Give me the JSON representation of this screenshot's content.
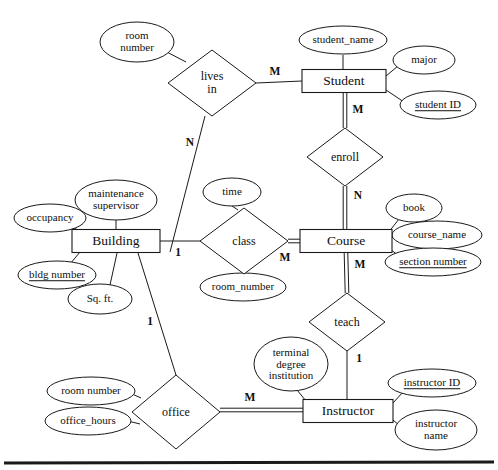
{
  "diagram": {
    "notation": "Chen",
    "stroke_color": "#1a1a1a",
    "fill_color": "#ffffff",
    "background": "#ffffff",
    "entities": [
      {
        "id": "building",
        "label": "Building",
        "cx": 116,
        "cy": 241,
        "w": 88,
        "h": 23
      },
      {
        "id": "student",
        "label": "Student",
        "cx": 344,
        "cy": 81,
        "w": 84,
        "h": 23
      },
      {
        "id": "course",
        "label": "Course",
        "cx": 346,
        "cy": 241,
        "w": 92,
        "h": 23
      },
      {
        "id": "instructor",
        "label": "Instructor",
        "cx": 348,
        "cy": 411,
        "w": 90,
        "h": 23
      }
    ],
    "relationships": [
      {
        "id": "lives-in",
        "label": "lives\nin",
        "cx": 212,
        "cy": 83,
        "rx": 44,
        "ry": 33
      },
      {
        "id": "enroll",
        "label": "enroll",
        "cx": 345,
        "cy": 157,
        "rx": 38,
        "ry": 29
      },
      {
        "id": "class",
        "label": "class",
        "cx": 244,
        "cy": 241,
        "rx": 44,
        "ry": 33
      },
      {
        "id": "teach",
        "label": "teach",
        "cx": 347,
        "cy": 322,
        "rx": 38,
        "ry": 29
      },
      {
        "id": "office",
        "label": "office",
        "cx": 176,
        "cy": 412,
        "rx": 44,
        "ry": 37
      }
    ],
    "attributes": [
      {
        "id": "room-number-lives-in",
        "label": "room\nnumber",
        "cx": 137,
        "cy": 42,
        "rx": 37,
        "ry": 20,
        "key": false,
        "owner": "lives-in"
      },
      {
        "id": "student-name",
        "label": "student_name",
        "cx": 343,
        "cy": 40,
        "rx": 44,
        "ry": 14,
        "key": false,
        "owner": "student"
      },
      {
        "id": "major",
        "label": "major",
        "cx": 424,
        "cy": 60,
        "rx": 31,
        "ry": 14,
        "key": false,
        "owner": "student"
      },
      {
        "id": "student-id",
        "label": "student ID",
        "cx": 438,
        "cy": 105,
        "rx": 38,
        "ry": 14,
        "key": true,
        "owner": "student"
      },
      {
        "id": "maintenance-supervisor",
        "label": "maintenance\nsupervisor",
        "cx": 116,
        "cy": 200,
        "rx": 41,
        "ry": 20,
        "key": false,
        "owner": "building"
      },
      {
        "id": "occupancy",
        "label": "occupancy",
        "cx": 50,
        "cy": 218,
        "rx": 36,
        "ry": 14,
        "key": false,
        "owner": "building"
      },
      {
        "id": "bldg-number",
        "label": "bldg number",
        "cx": 57,
        "cy": 275,
        "rx": 39,
        "ry": 14,
        "key": true,
        "owner": "building"
      },
      {
        "id": "sq-ft",
        "label": "Sq. ft.",
        "cx": 100,
        "cy": 299,
        "rx": 32,
        "ry": 15,
        "key": false,
        "owner": "building"
      },
      {
        "id": "time",
        "label": "time",
        "cx": 232,
        "cy": 192,
        "rx": 29,
        "ry": 14,
        "key": false,
        "owner": "class"
      },
      {
        "id": "room-number-class",
        "label": "room_number",
        "cx": 243,
        "cy": 287,
        "rx": 43,
        "ry": 14,
        "key": false,
        "owner": "class"
      },
      {
        "id": "book",
        "label": "book",
        "cx": 414,
        "cy": 208,
        "rx": 28,
        "ry": 14,
        "key": false,
        "owner": "course"
      },
      {
        "id": "course-name",
        "label": "course_name",
        "cx": 437,
        "cy": 235,
        "rx": 45,
        "ry": 14,
        "key": false,
        "owner": "course"
      },
      {
        "id": "section-number",
        "label": "section number",
        "cx": 433,
        "cy": 262,
        "rx": 48,
        "ry": 14,
        "key": true,
        "owner": "course"
      },
      {
        "id": "terminal-degree",
        "label": "terminal\ndegree\ninstitution",
        "cx": 291,
        "cy": 364,
        "rx": 37,
        "ry": 27,
        "key": false,
        "owner": "instructor"
      },
      {
        "id": "room-number-office",
        "label": "room number",
        "cx": 91,
        "cy": 391,
        "rx": 44,
        "ry": 14,
        "key": false,
        "owner": "office"
      },
      {
        "id": "office-hours",
        "label": "office_hours",
        "cx": 88,
        "cy": 421,
        "rx": 43,
        "ry": 14,
        "key": false,
        "owner": "office"
      },
      {
        "id": "instructor-id",
        "label": "instructor ID",
        "cx": 432,
        "cy": 383,
        "rx": 44,
        "ry": 14,
        "key": true,
        "owner": "instructor"
      },
      {
        "id": "instructor-name",
        "label": "instructor\nname",
        "cx": 436,
        "cy": 430,
        "rx": 41,
        "ry": 20,
        "key": false,
        "owner": "instructor"
      }
    ],
    "connectors": [
      {
        "id": "c-livesin-roomnumber",
        "from": "lives-in",
        "to": "room-number-lives-in",
        "x1": 186,
        "y1": 62,
        "x2": 163,
        "y2": 50,
        "double": false
      },
      {
        "id": "c-livesin-student",
        "from": "lives-in",
        "to": "student",
        "x1": 256,
        "y1": 83,
        "x2": 302,
        "y2": 81,
        "double": false
      },
      {
        "id": "c-livesin-building",
        "from": "lives-in",
        "to": "building",
        "x1": 205,
        "y1": 116,
        "x2": 170,
        "y2": 252,
        "double": false
      },
      {
        "id": "c-student-name",
        "from": "student",
        "to": "student-name",
        "x1": 343,
        "y1": 69,
        "x2": 343,
        "y2": 55,
        "double": false
      },
      {
        "id": "c-student-major",
        "from": "student",
        "to": "major",
        "x1": 386,
        "y1": 76,
        "x2": 398,
        "y2": 66,
        "double": false
      },
      {
        "id": "c-student-id",
        "from": "student",
        "to": "student-id",
        "x1": 386,
        "y1": 90,
        "x2": 404,
        "y2": 102,
        "double": false
      },
      {
        "id": "c-student-enroll",
        "from": "student",
        "to": "enroll",
        "x1": 345,
        "y1": 93,
        "x2": 345,
        "y2": 128,
        "double": true
      },
      {
        "id": "c-enroll-course",
        "from": "enroll",
        "to": "course",
        "x1": 345,
        "y1": 186,
        "x2": 345,
        "y2": 230,
        "double": true
      },
      {
        "id": "c-building-maint",
        "from": "building",
        "to": "maintenance-supervisor",
        "x1": 116,
        "y1": 230,
        "x2": 116,
        "y2": 220,
        "double": false
      },
      {
        "id": "c-building-occ",
        "from": "building",
        "to": "occupancy",
        "x1": 80,
        "y1": 231,
        "x2": 68,
        "y2": 225,
        "double": false
      },
      {
        "id": "c-building-bldgnum",
        "from": "building",
        "to": "bldg-number",
        "x1": 80,
        "y1": 252,
        "x2": 70,
        "y2": 264,
        "double": false
      },
      {
        "id": "c-building-sqft",
        "from": "building",
        "to": "sq-ft",
        "x1": 117,
        "y1": 253,
        "x2": 110,
        "y2": 285,
        "double": false
      },
      {
        "id": "c-building-class",
        "from": "building",
        "to": "class",
        "x1": 160,
        "y1": 241,
        "x2": 200,
        "y2": 241,
        "double": false
      },
      {
        "id": "c-class-time",
        "from": "class",
        "to": "time",
        "x1": 238,
        "y1": 210,
        "x2": 232,
        "y2": 206,
        "double": false
      },
      {
        "id": "c-class-roomnumber",
        "from": "class",
        "to": "room-number-class",
        "x1": 243,
        "y1": 273,
        "x2": 243,
        "y2": 274,
        "double": false
      },
      {
        "id": "c-class-course",
        "from": "class",
        "to": "course",
        "x1": 288,
        "y1": 241,
        "x2": 300,
        "y2": 241,
        "double": true
      },
      {
        "id": "c-course-book",
        "from": "course",
        "to": "book",
        "x1": 388,
        "y1": 233,
        "x2": 399,
        "y2": 219,
        "double": false
      },
      {
        "id": "c-course-coursename",
        "from": "course",
        "to": "course-name",
        "x1": 392,
        "y1": 238,
        "x2": 393,
        "y2": 236,
        "double": false
      },
      {
        "id": "c-course-section",
        "from": "course",
        "to": "section-number",
        "x1": 390,
        "y1": 249,
        "x2": 399,
        "y2": 256,
        "double": false
      },
      {
        "id": "c-course-teach",
        "from": "course",
        "to": "teach",
        "x1": 346,
        "y1": 253,
        "x2": 347,
        "y2": 293,
        "double": true
      },
      {
        "id": "c-teach-instructor",
        "from": "teach",
        "to": "instructor",
        "x1": 347,
        "y1": 351,
        "x2": 347,
        "y2": 400,
        "double": false
      },
      {
        "id": "c-building-office",
        "from": "building",
        "to": "office",
        "x1": 138,
        "y1": 253,
        "x2": 176,
        "y2": 375,
        "double": false
      },
      {
        "id": "c-office-roomnum",
        "from": "office",
        "to": "room-number-office",
        "x1": 141,
        "y1": 398,
        "x2": 130,
        "y2": 393,
        "double": false
      },
      {
        "id": "c-office-hours",
        "from": "office",
        "to": "office-hours",
        "x1": 140,
        "y1": 424,
        "x2": 128,
        "y2": 421,
        "double": false
      },
      {
        "id": "c-office-instructor",
        "from": "office",
        "to": "instructor",
        "x1": 220,
        "y1": 410,
        "x2": 303,
        "y2": 410,
        "double": true
      },
      {
        "id": "c-instructor-terminal",
        "from": "instructor",
        "to": "terminal-degree",
        "x1": 306,
        "y1": 401,
        "x2": 297,
        "y2": 390,
        "double": false
      },
      {
        "id": "c-instructor-id",
        "from": "instructor",
        "to": "instructor-id",
        "x1": 393,
        "y1": 403,
        "x2": 403,
        "y2": 392,
        "double": false
      },
      {
        "id": "c-instructor-name",
        "from": "instructor",
        "to": "instructor-name",
        "x1": 393,
        "y1": 420,
        "x2": 400,
        "y2": 426,
        "double": false
      }
    ],
    "cardinalities": [
      {
        "id": "card-livesin-student",
        "label": "M",
        "x": 275,
        "y": 72
      },
      {
        "id": "card-livesin-building",
        "label": "N",
        "x": 190,
        "y": 143
      },
      {
        "id": "card-student-enroll",
        "label": "M",
        "x": 358,
        "y": 110
      },
      {
        "id": "card-enroll-course",
        "label": "N",
        "x": 358,
        "y": 196
      },
      {
        "id": "card-building-class",
        "label": "1",
        "x": 178,
        "y": 253
      },
      {
        "id": "card-class-course",
        "label": "M",
        "x": 285,
        "y": 258
      },
      {
        "id": "card-course-teach",
        "label": "M",
        "x": 360,
        "y": 265
      },
      {
        "id": "card-teach-instructor",
        "label": "1",
        "x": 359,
        "y": 359
      },
      {
        "id": "card-building-office",
        "label": "1",
        "x": 150,
        "y": 322
      },
      {
        "id": "card-office-instructor",
        "label": "M",
        "x": 250,
        "y": 398
      }
    ],
    "footer_rule": {
      "id": "footer-rule",
      "x1": 4,
      "y1": 463,
      "x2": 494,
      "y2": 462,
      "thickness": 3
    }
  }
}
